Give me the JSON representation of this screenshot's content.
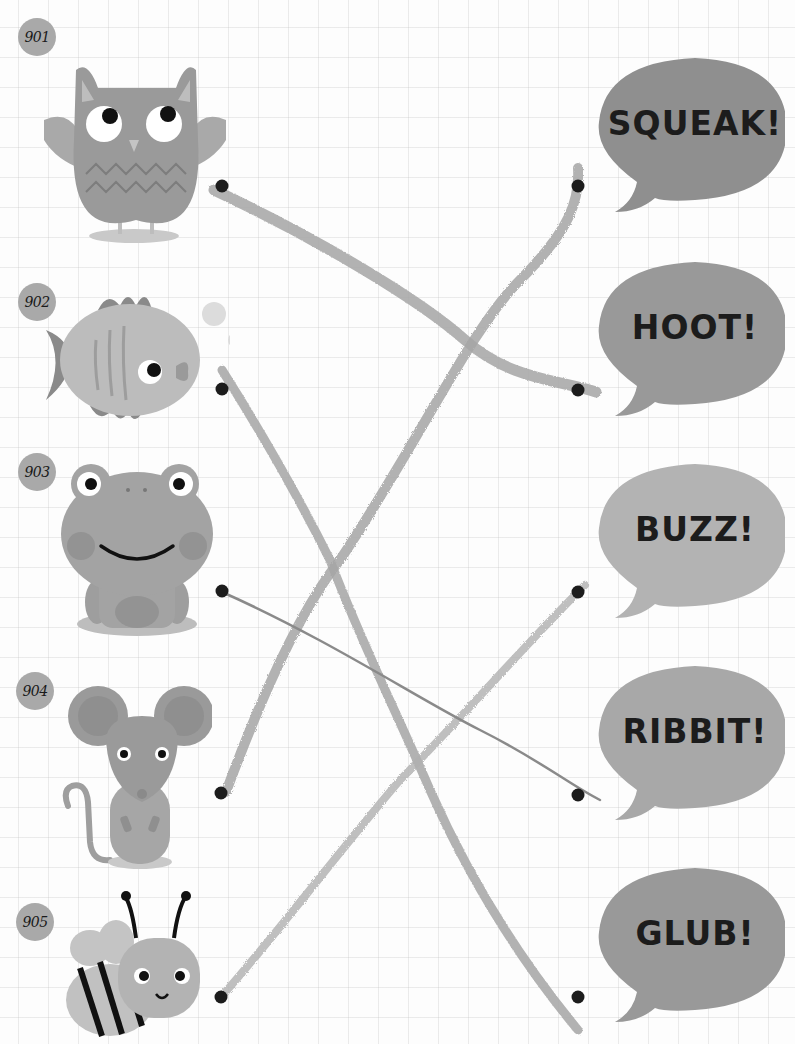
{
  "worksheet": {
    "title": "Match the animal to its sound",
    "colors": {
      "badge": "#a9a9a9",
      "bubble_dark": "#8f8f8f",
      "bubble_light": "#b3b3b3",
      "crayon_line": "#a6a6a6",
      "thin_line": "#8a8a8a",
      "dot": "#1c1c1c"
    },
    "animals": [
      {
        "number": "901",
        "name": "owl",
        "icon": "owl-icon"
      },
      {
        "number": "902",
        "name": "fish",
        "icon": "fish-icon"
      },
      {
        "number": "903",
        "name": "frog",
        "icon": "frog-icon"
      },
      {
        "number": "904",
        "name": "mouse",
        "icon": "mouse-icon"
      },
      {
        "number": "905",
        "name": "bee",
        "icon": "bee-icon"
      }
    ],
    "sounds": [
      {
        "label": "SQUEAK!",
        "shade": "dark"
      },
      {
        "label": "HOOT!",
        "shade": "dark"
      },
      {
        "label": "BUZZ!",
        "shade": "light"
      },
      {
        "label": "RIBBIT!",
        "shade": "light"
      },
      {
        "label": "GLUB!",
        "shade": "dark"
      }
    ],
    "connections": [
      {
        "from": "901",
        "to": "HOOT!",
        "style": "crayon"
      },
      {
        "from": "902",
        "to": "GLUB!",
        "style": "crayon"
      },
      {
        "from": "903",
        "to": "RIBBIT!",
        "style": "thin"
      },
      {
        "from": "904",
        "to": "SQUEAK!",
        "style": "crayon"
      },
      {
        "from": "905",
        "to": "BUZZ!",
        "style": "crayon"
      }
    ]
  }
}
